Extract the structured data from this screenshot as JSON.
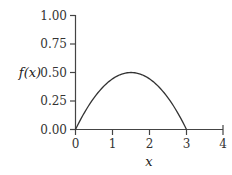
{
  "chart_data": {
    "type": "line",
    "title": "",
    "xlabel": "x",
    "ylabel": "f(x)",
    "xlim": [
      0,
      4
    ],
    "ylim": [
      0,
      1
    ],
    "x_ticks": [
      "0",
      "1",
      "2",
      "3",
      "4"
    ],
    "y_ticks": [
      "0.00",
      "0.25",
      "0.50",
      "0.75",
      "1.00"
    ],
    "grid": false,
    "legend": null,
    "series": [
      {
        "name": "f(x)",
        "function": "f(x) = (2/9) x (3 - x), 0 <= x <= 3",
        "x": [
          0,
          0.5,
          1,
          1.5,
          2,
          2.5,
          3
        ],
        "values": [
          0,
          0.278,
          0.444,
          0.5,
          0.444,
          0.278,
          0
        ]
      }
    ]
  }
}
